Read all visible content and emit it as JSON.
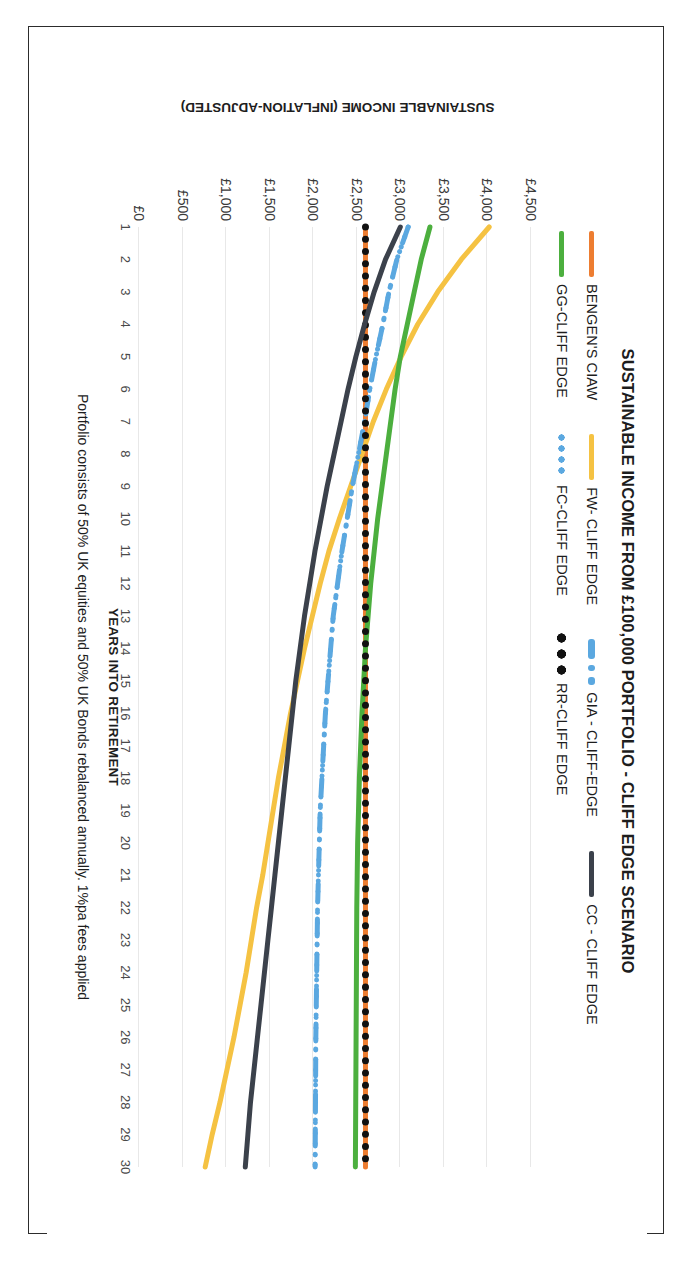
{
  "chart_data": {
    "type": "line",
    "title": "SUSTAINABLE INCOME FROM £100,000 PORTFOLIO - CLIFF EDGE SCENARIO",
    "xlabel": "YEARS INTO RETIREMENT",
    "ylabel": "SUSTAINABLE INCOME (INFLATION-ADJUSTED)",
    "footnote": "Portfolio consists of 50% UK equities and 50% UK Bonds rebalanced annually.  1%pa fees applied",
    "grid": true,
    "legend_position": "top",
    "orientation": "rotated-90-clockwise",
    "ylim": [
      0,
      4500
    ],
    "yticks": [
      4500,
      4000,
      3500,
      3000,
      2500,
      2000,
      1500,
      1000,
      500,
      0
    ],
    "ytick_labels": [
      "£4,500",
      "£4,000",
      "£3,500",
      "£3,000",
      "£2,500",
      "£2,000",
      "£1,500",
      "£1,000",
      "£500",
      "£0"
    ],
    "xlim": [
      1,
      30
    ],
    "x": [
      1,
      2,
      3,
      4,
      5,
      6,
      7,
      8,
      9,
      10,
      11,
      12,
      13,
      14,
      15,
      16,
      17,
      18,
      19,
      20,
      21,
      22,
      23,
      24,
      25,
      26,
      27,
      28,
      29,
      30
    ],
    "xtick_labels": [
      "1",
      "2",
      "3",
      "4",
      "5",
      "6",
      "7",
      "8",
      "9",
      "10",
      "11",
      "12",
      "13",
      "14",
      "15",
      "16",
      "17",
      "18",
      "19",
      "20",
      "21",
      "22",
      "23",
      "24",
      "25",
      "26",
      "27",
      "28",
      "29",
      "30"
    ],
    "series": [
      {
        "name": "BENGEN'S CIAW",
        "color": "#ED7D31",
        "style": "solid",
        "width": 5,
        "values": [
          2600,
          2600,
          2600,
          2600,
          2600,
          2600,
          2600,
          2600,
          2600,
          2600,
          2600,
          2600,
          2600,
          2600,
          2600,
          2600,
          2600,
          2600,
          2600,
          2600,
          2600,
          2600,
          2600,
          2600,
          2600,
          2600,
          2600,
          2600,
          2600,
          2600
        ]
      },
      {
        "name": "FW- CLIFF EDGE",
        "color": "#F5C242",
        "style": "solid",
        "width": 5,
        "values": [
          4020,
          3700,
          3430,
          3200,
          3010,
          2840,
          2690,
          2560,
          2430,
          2300,
          2180,
          2080,
          1990,
          1900,
          1820,
          1740,
          1670,
          1600,
          1540,
          1480,
          1420,
          1350,
          1290,
          1230,
          1160,
          1090,
          1010,
          930,
          840,
          760
        ]
      },
      {
        "name": "GIA - CLIFF-EDGE",
        "color": "#5BA8E0",
        "style": "dash-dot",
        "width": 5,
        "values": [
          3090,
          2960,
          2870,
          2800,
          2720,
          2650,
          2590,
          2520,
          2450,
          2390,
          2330,
          2280,
          2230,
          2200,
          2170,
          2140,
          2120,
          2100,
          2080,
          2070,
          2060,
          2050,
          2045,
          2040,
          2035,
          2030,
          2028,
          2026,
          2024,
          2022
        ]
      },
      {
        "name": "GG-CLIFF EDGE",
        "color": "#4CAF3E",
        "style": "solid",
        "width": 5,
        "values": [
          3340,
          3240,
          3160,
          3080,
          3000,
          2940,
          2890,
          2840,
          2790,
          2740,
          2700,
          2660,
          2630,
          2600,
          2580,
          2560,
          2545,
          2530,
          2520,
          2510,
          2505,
          2500,
          2498,
          2496,
          2494,
          2492,
          2490,
          2488,
          2486,
          2484
        ]
      },
      {
        "name": "FC-CLIFF EDGE",
        "color": "#5BA8E0",
        "style": "dotted",
        "width": 5,
        "values": [
          3090,
          2960,
          2870,
          2800,
          2720,
          2650,
          2590,
          2520,
          2450,
          2390,
          2330,
          2280,
          2230,
          2200,
          2170,
          2140,
          2120,
          2100,
          2080,
          2070,
          2060,
          2050,
          2045,
          2040,
          2035,
          2030,
          2028,
          2026,
          2024,
          2022
        ]
      },
      {
        "name": "RR-CLIFF EDGE",
        "color": "#111111",
        "style": "thick-dotted",
        "width": 7,
        "values": [
          2600,
          2600,
          2600,
          2600,
          2600,
          2600,
          2600,
          2600,
          2600,
          2600,
          2600,
          2600,
          2600,
          2600,
          2600,
          2600,
          2600,
          2600,
          2600,
          2600,
          2600,
          2600,
          2600,
          2600,
          2600,
          2600,
          2600,
          2600,
          2600,
          2600
        ]
      },
      {
        "name": "CC - CLIFF EDGE",
        "color": "#3B414B",
        "style": "solid",
        "width": 5,
        "values": [
          3000,
          2830,
          2700,
          2590,
          2490,
          2400,
          2320,
          2240,
          2160,
          2090,
          2020,
          1960,
          1900,
          1850,
          1800,
          1760,
          1720,
          1680,
          1640,
          1600,
          1560,
          1520,
          1480,
          1440,
          1400,
          1360,
          1320,
          1280,
          1250,
          1220
        ]
      }
    ]
  },
  "legend": {
    "row1": [
      "BENGEN'S CIAW",
      "FW- CLIFF EDGE",
      "GIA - CLIFF-EDGE",
      "CC - CLIFF EDGE"
    ],
    "row2": [
      "GG-CLIFF EDGE",
      "FC-CLIFF EDGE",
      "RR-CLIFF EDGE"
    ]
  }
}
